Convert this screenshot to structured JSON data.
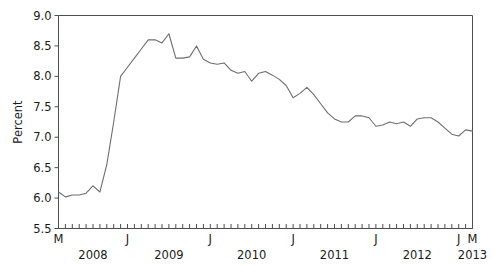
{
  "chart_data": {
    "type": "line",
    "title": "",
    "xlabel": "",
    "ylabel": "Percent",
    "ylim": [
      5.5,
      9.0
    ],
    "yticks": [
      5.5,
      6.0,
      6.5,
      7.0,
      7.5,
      8.0,
      8.5,
      9.0
    ],
    "ytick_labels": [
      "5.5",
      "6.0",
      "6.5",
      "7.0",
      "7.5",
      "8.0",
      "8.5",
      "9.0"
    ],
    "grid": false,
    "legend": "none",
    "line_color": "#6e6e6e",
    "axis_color": "#4d4d4d",
    "background_color": "#ffffff",
    "x_axis": {
      "minor_ticks": "monthly",
      "month_labels": [
        {
          "index": 0,
          "label": "M"
        },
        {
          "index": 10,
          "label": "J"
        },
        {
          "index": 22,
          "label": "J"
        },
        {
          "index": 34,
          "label": "J"
        },
        {
          "index": 46,
          "label": "J"
        },
        {
          "index": 58,
          "label": "J"
        },
        {
          "index": 60,
          "label": "M"
        }
      ],
      "year_labels": [
        {
          "index": 5,
          "label": "2008"
        },
        {
          "index": 16,
          "label": "2009"
        },
        {
          "index": 28,
          "label": "2010"
        },
        {
          "index": 40,
          "label": "2011"
        },
        {
          "index": 52,
          "label": "2012"
        },
        {
          "index": 60,
          "label": "2013"
        }
      ]
    },
    "x": [
      "2008-03",
      "2008-04",
      "2008-05",
      "2008-06",
      "2008-07",
      "2008-08",
      "2008-09",
      "2008-10",
      "2008-11",
      "2008-12",
      "2009-01",
      "2009-02",
      "2009-03",
      "2009-04",
      "2009-05",
      "2009-06",
      "2009-07",
      "2009-08",
      "2009-09",
      "2009-10",
      "2009-11",
      "2009-12",
      "2010-01",
      "2010-02",
      "2010-03",
      "2010-04",
      "2010-05",
      "2010-06",
      "2010-07",
      "2010-08",
      "2010-09",
      "2010-10",
      "2010-11",
      "2010-12",
      "2011-01",
      "2011-02",
      "2011-03",
      "2011-04",
      "2011-05",
      "2011-06",
      "2011-07",
      "2011-08",
      "2011-09",
      "2011-10",
      "2011-11",
      "2011-12",
      "2012-01",
      "2012-02",
      "2012-03",
      "2012-04",
      "2012-05",
      "2012-06",
      "2012-07",
      "2012-08",
      "2012-09",
      "2012-10",
      "2012-11",
      "2012-12",
      "2013-01",
      "2013-02",
      "2013-03"
    ],
    "values": [
      6.1,
      6.02,
      6.05,
      6.05,
      6.08,
      6.2,
      6.1,
      6.55,
      7.25,
      8.0,
      8.15,
      8.3,
      8.45,
      8.6,
      8.6,
      8.55,
      8.7,
      8.3,
      8.3,
      8.32,
      8.5,
      8.28,
      8.22,
      8.2,
      8.22,
      8.1,
      8.05,
      8.08,
      7.92,
      8.05,
      8.08,
      8.02,
      7.95,
      7.85,
      7.65,
      7.72,
      7.82,
      7.7,
      7.55,
      7.4,
      7.3,
      7.25,
      7.25,
      7.35,
      7.35,
      7.32,
      7.18,
      7.2,
      7.25,
      7.22,
      7.25,
      7.18,
      7.3,
      7.32,
      7.32,
      7.25,
      7.15,
      7.05,
      7.02,
      7.12,
      7.1
    ]
  }
}
